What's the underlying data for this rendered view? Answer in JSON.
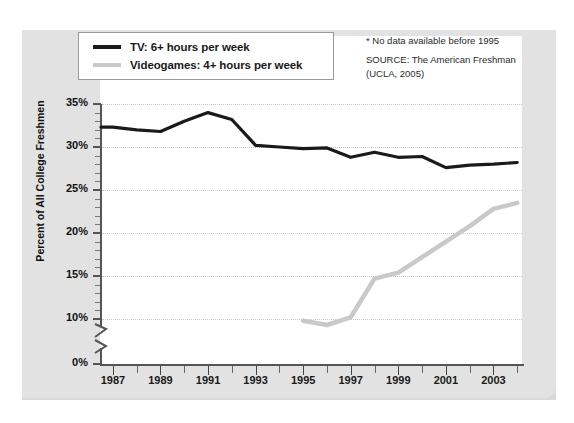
{
  "legend": {
    "items": [
      {
        "label": "TV: 6+ hours per week",
        "color": "#1a1a1a",
        "key": "tv"
      },
      {
        "label": "Videogames: 4+ hours per week",
        "color": "#c9c9c9",
        "key": "videogames"
      }
    ]
  },
  "notes": {
    "footnote": "* No data available before 1995",
    "source_line1": "SOURCE: The American Freshman",
    "source_line2": "(UCLA, 2005)"
  },
  "chart_data": {
    "type": "line",
    "title": "",
    "xlabel": "",
    "ylabel": "Percent of All College Freshmen",
    "ylim": [
      10,
      35
    ],
    "y_axis_break": true,
    "y_break_between": [
      0,
      10
    ],
    "ytick_labels": [
      "0%",
      "10%",
      "15%",
      "20%",
      "25%",
      "30%",
      "35%"
    ],
    "xtick_labels": [
      "1987",
      "1989",
      "1991",
      "1993",
      "1995",
      "1997",
      "1999",
      "2001",
      "2003"
    ],
    "xlim": [
      1986.5,
      2004.2
    ],
    "grid": true,
    "legend_position": "top-left",
    "x": [
      1987,
      1988,
      1989,
      1990,
      1991,
      1992,
      1993,
      1994,
      1995,
      1996,
      1997,
      1998,
      1999,
      2000,
      2001,
      2002,
      2003,
      2004
    ],
    "series": [
      {
        "name": "TV: 6+ hours per week",
        "color": "#1a1a1a",
        "values": [
          32.3,
          32.0,
          31.8,
          33.0,
          34.0,
          33.2,
          30.2,
          30.0,
          29.8,
          29.9,
          28.8,
          29.4,
          28.8,
          28.9,
          27.6,
          27.9,
          28.0,
          28.2
        ]
      },
      {
        "name": "Videogames: 4+ hours per week",
        "color": "#c9c9c9",
        "values": [
          null,
          null,
          null,
          null,
          null,
          null,
          null,
          null,
          9.8,
          9.3,
          10.2,
          14.7,
          15.4,
          17.2,
          19.0,
          20.8,
          22.8,
          23.5
        ]
      }
    ]
  }
}
